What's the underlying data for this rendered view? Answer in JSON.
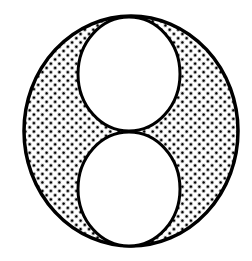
{
  "figure": {
    "colors": {
      "background": "#ffffff",
      "stroke": "#000000",
      "dot": "#000000",
      "inner_fill": "#ffffff"
    },
    "outer_circle": {
      "cx": 131,
      "cy": 131,
      "rx": 107,
      "ry": 115
    },
    "inner_circles": [
      {
        "name": "top",
        "cx": 129,
        "cy": 74,
        "rx": 51,
        "ry": 57
      },
      {
        "name": "bottom",
        "cx": 129,
        "cy": 189,
        "rx": 51,
        "ry": 57
      }
    ],
    "pattern": {
      "type": "halftone-dots",
      "spacing": 6,
      "dot_radius": 1.5
    }
  }
}
